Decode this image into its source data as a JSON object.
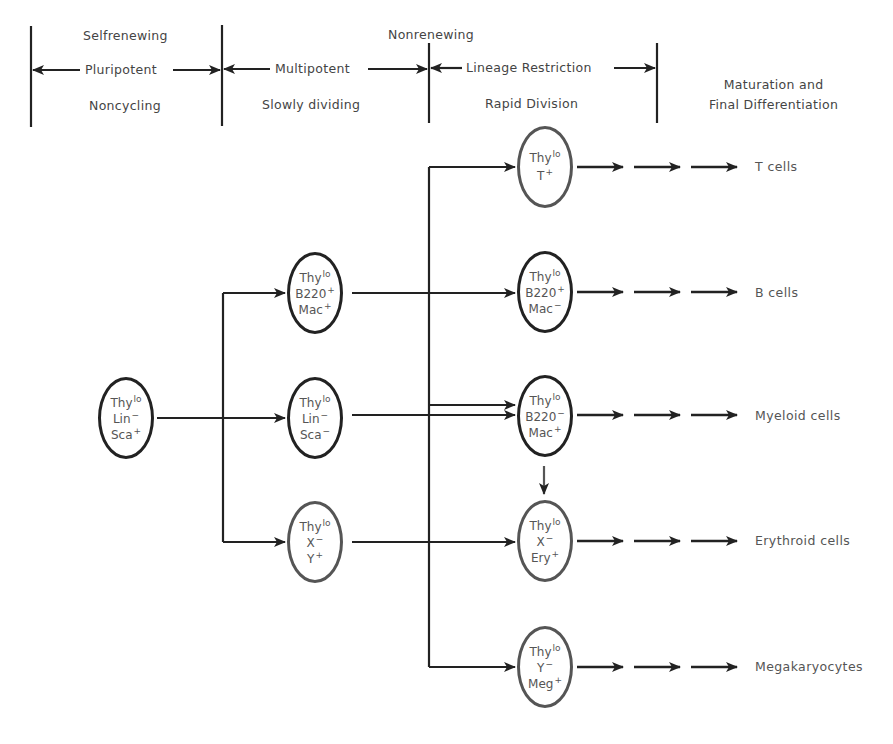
{
  "header": {
    "top_labels": {
      "left": "Selfrenewing",
      "center": "Nonrenewing"
    },
    "stages": [
      {
        "arrow_label": "Pluripotent",
        "sub_label": "Noncycling"
      },
      {
        "arrow_label": "Multipotent",
        "sub_label": "Slowly dividing"
      },
      {
        "arrow_label": "Lineage Restriction",
        "sub_label": "Rapid Division"
      }
    ],
    "final_stage": {
      "line1": "Maturation and",
      "line2": "Final Differentiation"
    }
  },
  "cells": {
    "stem": {
      "lines": [
        {
          "name": "Thy",
          "mark": "lo"
        },
        {
          "name": "Lin",
          "mark": "−"
        },
        {
          "name": "Sca",
          "mark": "+"
        }
      ]
    },
    "multipotent": [
      {
        "lines": [
          {
            "name": "Thy",
            "mark": "lo"
          },
          {
            "name": "B220",
            "mark": "+"
          },
          {
            "name": "Mac",
            "mark": "+"
          }
        ]
      },
      {
        "lines": [
          {
            "name": "Thy",
            "mark": "lo"
          },
          {
            "name": "Lin",
            "mark": "−"
          },
          {
            "name": "Sca",
            "mark": "−"
          }
        ]
      },
      {
        "lines": [
          {
            "name": "Thy",
            "mark": "lo"
          },
          {
            "name": "X",
            "mark": "−"
          },
          {
            "name": "Y",
            "mark": "+"
          }
        ]
      }
    ],
    "restricted": [
      {
        "lines": [
          {
            "name": "Thy",
            "mark": "lo"
          },
          {
            "name": "T",
            "mark": "+"
          }
        ]
      },
      {
        "lines": [
          {
            "name": "Thy",
            "mark": "lo"
          },
          {
            "name": "B220",
            "mark": "+"
          },
          {
            "name": "Mac",
            "mark": "−"
          }
        ]
      },
      {
        "lines": [
          {
            "name": "Thy",
            "mark": "lo"
          },
          {
            "name": "B220",
            "mark": "−"
          },
          {
            "name": "Mac",
            "mark": "+"
          }
        ]
      },
      {
        "lines": [
          {
            "name": "Thy",
            "mark": "lo"
          },
          {
            "name": "X",
            "mark": "−"
          },
          {
            "name": "Ery",
            "mark": "+"
          }
        ]
      },
      {
        "lines": [
          {
            "name": "Thy",
            "mark": "lo"
          },
          {
            "name": "Y",
            "mark": "−"
          },
          {
            "name": "Meg",
            "mark": "+"
          }
        ]
      }
    ]
  },
  "fates": [
    "T cells",
    "B cells",
    "Myeloid cells",
    "Erythroid cells",
    "Megakaryocytes"
  ],
  "colors": {
    "line": "#222222",
    "text": "#444444",
    "grey_outline": "#555555"
  }
}
